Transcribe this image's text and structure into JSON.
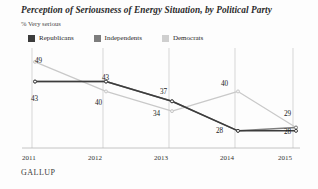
{
  "chart_data": {
    "type": "line",
    "title": "Perception of Seriousness of Energy Situation, by Political Party",
    "subtitle": "% Very serious",
    "xlabel": "",
    "ylabel": "",
    "categories": [
      "2011",
      "2012",
      "2013",
      "2014",
      "2015"
    ],
    "x": [
      2011,
      2012,
      2013,
      2014,
      2015
    ],
    "ylim": [
      24,
      52
    ],
    "grid": "vertical",
    "legend_position": "top-left",
    "source": "GALLUP",
    "series": [
      {
        "name": "Republicans",
        "color": "#3c3c3c",
        "values": [
          43,
          43,
          37,
          28,
          28
        ],
        "labels": [
          "43",
          "43",
          "37",
          "28",
          "28"
        ]
      },
      {
        "name": "Independents",
        "color": "#7d7d7d",
        "values": [
          43,
          43,
          37,
          28,
          29
        ],
        "labels": [
          "43",
          "43",
          "37",
          "28",
          "29"
        ]
      },
      {
        "name": "Democrats",
        "color": "#c9c9c9",
        "values": [
          49,
          40,
          34,
          40,
          29
        ],
        "labels": [
          "49",
          "40",
          "34",
          "40",
          "29"
        ]
      }
    ],
    "point_labels": [
      {
        "text": "49",
        "x": 35,
        "y": 57,
        "anchor": "start"
      },
      {
        "text": "43",
        "x": 31,
        "y": 95,
        "anchor": "start"
      },
      {
        "text": "43",
        "x": 102,
        "y": 74,
        "anchor": "start"
      },
      {
        "text": "40",
        "x": 95,
        "y": 99,
        "anchor": "start"
      },
      {
        "text": "37",
        "x": 160,
        "y": 88,
        "anchor": "start"
      },
      {
        "text": "34",
        "x": 153,
        "y": 110,
        "anchor": "start"
      },
      {
        "text": "40",
        "x": 221,
        "y": 80,
        "anchor": "start"
      },
      {
        "text": "28",
        "x": 216,
        "y": 127,
        "anchor": "start"
      },
      {
        "text": "29",
        "x": 284,
        "y": 110,
        "anchor": "start"
      },
      {
        "text": "28",
        "x": 284,
        "y": 128,
        "anchor": "start"
      }
    ]
  },
  "legend": {
    "items": [
      {
        "label": "Republicans",
        "color": "#3c3c3c"
      },
      {
        "label": "Independents",
        "color": "#7d7d7d"
      },
      {
        "label": "Democrats",
        "color": "#cfcfcf"
      }
    ]
  },
  "axis": {
    "ticks": [
      {
        "label": "2011",
        "x": 22
      },
      {
        "label": "2012",
        "x": 88
      },
      {
        "label": "2013",
        "x": 154
      },
      {
        "label": "2014",
        "x": 220
      },
      {
        "label": "2015",
        "x": 278
      }
    ]
  },
  "footer": {
    "brand": "GALLUP"
  }
}
